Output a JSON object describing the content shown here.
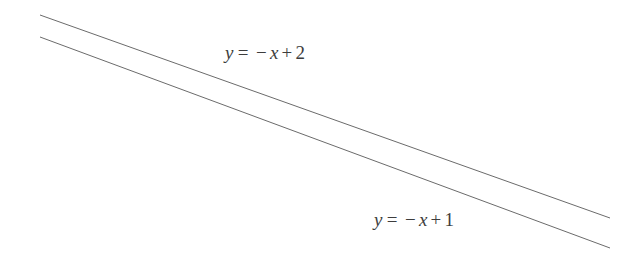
{
  "figure": {
    "kind": "line-graph",
    "width": 643,
    "height": 263,
    "background_color": "#ffffff",
    "line_color": "#6b6b6b",
    "text_color": "#3d3d3d",
    "line_width": 1
  },
  "labels": {
    "upper": {
      "full_text": "y = −x + 2",
      "lhs": "y",
      "relation": "=",
      "minus": "−",
      "variable": "x",
      "plus": "+",
      "constant": "2"
    },
    "lower": {
      "full_text": "y = −x + 1",
      "lhs": "y",
      "relation": "=",
      "minus": "−",
      "variable": "x",
      "plus": "+",
      "constant": "1"
    }
  },
  "chart_data": {
    "type": "line",
    "title": "",
    "xlabel": "",
    "ylabel": "",
    "grid": false,
    "axes_visible": false,
    "legend": "inline-annotations",
    "annotations": [
      {
        "text": "y = −x + 2",
        "x_px": 275,
        "y_px": 52,
        "series": "y = -x + 2"
      },
      {
        "text": "y = −x + 1",
        "x_px": 424,
        "y_px": 219,
        "series": "y = -x + 1"
      }
    ],
    "series": [
      {
        "name": "y = -x + 2",
        "equation": "y = -x + 2",
        "slope": -1,
        "intercept": 2,
        "color": "#6b6b6b",
        "pixel_endpoints": [
          [
            40,
            15
          ],
          [
            610,
            218
          ]
        ]
      },
      {
        "name": "y = -x + 1",
        "equation": "y = -x + 1",
        "slope": -1,
        "intercept": 1,
        "color": "#6b6b6b",
        "pixel_endpoints": [
          [
            40,
            37
          ],
          [
            610,
            248
          ]
        ]
      }
    ]
  }
}
